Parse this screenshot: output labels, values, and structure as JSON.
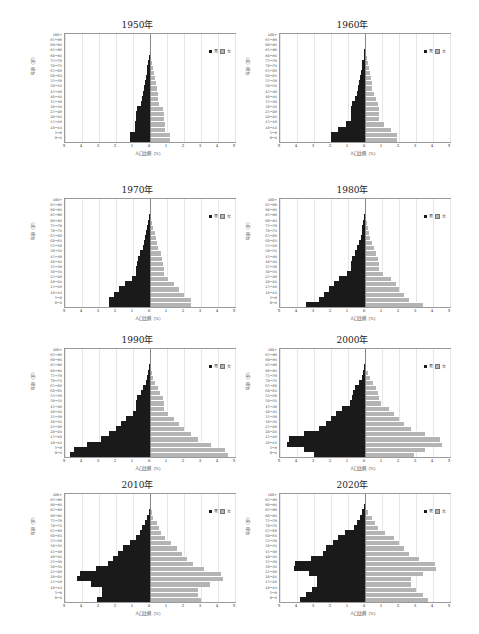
{
  "chart_data": [
    {
      "type": "bar",
      "title": "1950年",
      "xlabel": "人口比例（%）",
      "ylabel": "年龄（岁）",
      "categories": [
        "0-4",
        "5-9",
        "10-14",
        "15-19",
        "20-24",
        "25-29",
        "30-34",
        "35-39",
        "40-44",
        "45-49",
        "50-54",
        "55-59",
        "60-64",
        "65-69",
        "70-74",
        "75-79",
        "80-84",
        "85-89",
        "90-94",
        "95-99",
        "100+"
      ],
      "series": [
        {
          "name": "男",
          "values": [
            1.2,
            1.2,
            0.9,
            0.9,
            0.85,
            0.8,
            0.75,
            0.55,
            0.45,
            0.4,
            0.35,
            0.3,
            0.25,
            0.2,
            0.15,
            0.1,
            0.05,
            0.02,
            0.01,
            0.0,
            0.0
          ]
        },
        {
          "name": "女",
          "values": [
            1.2,
            1.2,
            0.9,
            0.9,
            0.85,
            0.8,
            0.75,
            0.55,
            0.45,
            0.45,
            0.4,
            0.35,
            0.3,
            0.25,
            0.2,
            0.1,
            0.06,
            0.03,
            0.01,
            0.0,
            0.0
          ]
        }
      ],
      "xlim": [
        -5,
        5
      ],
      "xticks": [
        "5",
        "4",
        "3",
        "2",
        "1",
        "0",
        "1",
        "2",
        "3",
        "4",
        "5"
      ],
      "grid": true,
      "legend_position": "upper right"
    },
    {
      "type": "bar",
      "title": "1960年",
      "xlabel": "人口比例（%）",
      "ylabel": "年龄（岁）",
      "categories": [
        "0-4",
        "5-9",
        "10-14",
        "15-19",
        "20-24",
        "25-29",
        "30-34",
        "35-39",
        "40-44",
        "45-49",
        "50-54",
        "55-59",
        "60-64",
        "65-69",
        "70-74",
        "75-79",
        "80-84",
        "85-89",
        "90-94",
        "95-99",
        "100+"
      ],
      "series": [
        {
          "name": "男",
          "values": [
            2.0,
            2.0,
            1.6,
            1.1,
            0.85,
            0.85,
            0.8,
            0.75,
            0.6,
            0.5,
            0.4,
            0.35,
            0.3,
            0.25,
            0.2,
            0.15,
            0.08,
            0.04,
            0.02,
            0.0,
            0.0
          ]
        },
        {
          "name": "女",
          "values": [
            1.9,
            1.9,
            1.5,
            1.1,
            0.85,
            0.85,
            0.8,
            0.75,
            0.65,
            0.5,
            0.4,
            0.4,
            0.35,
            0.3,
            0.25,
            0.2,
            0.1,
            0.05,
            0.02,
            0.0,
            0.0
          ]
        }
      ],
      "xlim": [
        -5,
        5
      ],
      "xticks": [
        "5",
        "4",
        "3",
        "2",
        "1",
        "0",
        "1",
        "2",
        "3",
        "4",
        "5"
      ],
      "grid": true,
      "legend_position": "upper right"
    },
    {
      "type": "bar",
      "title": "1970年",
      "xlabel": "人口比例（%）",
      "ylabel": "年龄（岁）",
      "categories": [
        "0-4",
        "5-9",
        "10-14",
        "15-19",
        "20-24",
        "25-29",
        "30-34",
        "35-39",
        "40-44",
        "45-49",
        "50-54",
        "55-59",
        "60-64",
        "65-69",
        "70-74",
        "75-79",
        "80-84",
        "85-89",
        "90-94",
        "95-99",
        "100+"
      ],
      "series": [
        {
          "name": "男",
          "values": [
            2.4,
            2.4,
            2.1,
            1.8,
            1.5,
            1.05,
            0.8,
            0.8,
            0.75,
            0.7,
            0.6,
            0.4,
            0.35,
            0.3,
            0.25,
            0.15,
            0.1,
            0.05,
            0.02,
            0.0,
            0.0
          ]
        },
        {
          "name": "女",
          "values": [
            2.4,
            2.4,
            2.0,
            1.7,
            1.4,
            1.05,
            0.8,
            0.8,
            0.75,
            0.7,
            0.65,
            0.45,
            0.4,
            0.35,
            0.3,
            0.2,
            0.12,
            0.06,
            0.02,
            0.0,
            0.0
          ]
        }
      ],
      "xlim": [
        -5,
        5
      ],
      "xticks": [
        "5",
        "4",
        "3",
        "2",
        "1",
        "0",
        "1",
        "2",
        "3",
        "4",
        "5"
      ],
      "grid": true,
      "legend_position": "upper right"
    },
    {
      "type": "bar",
      "title": "1980年",
      "xlabel": "人口比例（%）",
      "ylabel": "年龄（岁）",
      "categories": [
        "0-4",
        "5-9",
        "10-14",
        "15-19",
        "20-24",
        "25-29",
        "30-34",
        "35-39",
        "40-44",
        "45-49",
        "50-54",
        "55-59",
        "60-64",
        "65-69",
        "70-74",
        "75-79",
        "80-84",
        "85-89",
        "90-94",
        "95-99",
        "100+"
      ],
      "series": [
        {
          "name": "男",
          "values": [
            3.5,
            2.7,
            2.4,
            2.1,
            1.85,
            1.55,
            1.05,
            0.8,
            0.8,
            0.75,
            0.6,
            0.45,
            0.35,
            0.25,
            0.2,
            0.15,
            0.1,
            0.05,
            0.02,
            0.0,
            0.0
          ]
        },
        {
          "name": "女",
          "values": [
            3.4,
            2.6,
            2.3,
            2.0,
            1.8,
            1.5,
            1.05,
            0.8,
            0.8,
            0.75,
            0.65,
            0.5,
            0.4,
            0.3,
            0.25,
            0.2,
            0.12,
            0.06,
            0.02,
            0.0,
            0.0
          ]
        }
      ],
      "xlim": [
        -5,
        5
      ],
      "xticks": [
        "5",
        "4",
        "3",
        "2",
        "1",
        "0",
        "1",
        "2",
        "3",
        "4",
        "5"
      ],
      "grid": true,
      "legend_position": "upper right"
    },
    {
      "type": "bar",
      "title": "1990年",
      "xlabel": "人口比例（%）",
      "ylabel": "年龄（岁）",
      "categories": [
        "0-4",
        "5-9",
        "10-14",
        "15-19",
        "20-24",
        "25-29",
        "30-34",
        "35-39",
        "40-44",
        "45-49",
        "50-54",
        "55-59",
        "60-64",
        "65-69",
        "70-74",
        "75-79",
        "80-84",
        "85-89",
        "90-94",
        "95-99",
        "100+"
      ],
      "series": [
        {
          "name": "男",
          "values": [
            4.7,
            4.5,
            3.7,
            2.9,
            2.4,
            2.0,
            1.7,
            1.4,
            1.0,
            0.8,
            0.8,
            0.75,
            0.55,
            0.4,
            0.25,
            0.15,
            0.1,
            0.05,
            0.02,
            0.0,
            0.0
          ]
        },
        {
          "name": "女",
          "values": [
            4.6,
            4.4,
            3.6,
            2.8,
            2.4,
            2.0,
            1.7,
            1.4,
            1.05,
            0.8,
            0.8,
            0.75,
            0.6,
            0.45,
            0.3,
            0.2,
            0.12,
            0.06,
            0.02,
            0.0,
            0.0
          ]
        }
      ],
      "xlim": [
        -5,
        5
      ],
      "xticks": [
        "5",
        "4",
        "3",
        "2",
        "1",
        "0",
        "1",
        "2",
        "3",
        "4",
        "5"
      ],
      "grid": true,
      "legend_position": "upper right"
    },
    {
      "type": "bar",
      "title": "2000年",
      "xlabel": "人口比例（%）",
      "ylabel": "年龄（岁）",
      "categories": [
        "0-4",
        "5-9",
        "10-14",
        "15-19",
        "20-24",
        "25-29",
        "30-34",
        "35-39",
        "40-44",
        "45-49",
        "50-54",
        "55-59",
        "60-64",
        "65-69",
        "70-74",
        "75-79",
        "80-84",
        "85-89",
        "90-94",
        "95-99",
        "100+"
      ],
      "series": [
        {
          "name": "男",
          "values": [
            3.0,
            3.6,
            4.6,
            4.5,
            3.6,
            2.7,
            2.3,
            2.0,
            1.7,
            1.35,
            0.9,
            0.75,
            0.7,
            0.6,
            0.35,
            0.2,
            0.1,
            0.05,
            0.02,
            0.0,
            0.0
          ]
        },
        {
          "name": "女",
          "values": [
            2.9,
            3.5,
            4.5,
            4.4,
            3.5,
            2.7,
            2.3,
            2.0,
            1.7,
            1.4,
            0.95,
            0.8,
            0.75,
            0.65,
            0.45,
            0.3,
            0.15,
            0.07,
            0.02,
            0.0,
            0.0
          ]
        }
      ],
      "xlim": [
        -5,
        5
      ],
      "xticks": [
        "5",
        "4",
        "3",
        "2",
        "1",
        "0",
        "1",
        "2",
        "3",
        "4",
        "5"
      ],
      "grid": true,
      "legend_position": "upper right"
    },
    {
      "type": "bar",
      "title": "2010年",
      "xlabel": "人口比例（%）",
      "ylabel": "年龄（岁）",
      "categories": [
        "0-4",
        "5-9",
        "10-14",
        "15-19",
        "20-24",
        "25-29",
        "30-34",
        "35-39",
        "40-44",
        "45-49",
        "50-54",
        "55-59",
        "60-64",
        "65-69",
        "70-74",
        "75-79",
        "80-84",
        "85-89",
        "90-94",
        "95-99",
        "100+"
      ],
      "series": [
        {
          "name": "男",
          "values": [
            3.1,
            2.8,
            2.8,
            3.5,
            4.3,
            4.1,
            3.2,
            2.5,
            2.2,
            1.9,
            1.6,
            1.2,
            0.8,
            0.6,
            0.5,
            0.3,
            0.15,
            0.07,
            0.02,
            0.0,
            0.0
          ]
        },
        {
          "name": "女",
          "values": [
            3.0,
            2.8,
            2.8,
            3.5,
            4.3,
            4.2,
            3.2,
            2.5,
            2.2,
            1.9,
            1.6,
            1.25,
            0.9,
            0.65,
            0.55,
            0.4,
            0.2,
            0.1,
            0.03,
            0.0,
            0.0
          ]
        }
      ],
      "xlim": [
        -5,
        5
      ],
      "xticks": [
        "5",
        "4",
        "3",
        "2",
        "1",
        "0",
        "1",
        "2",
        "3",
        "4",
        "5"
      ],
      "grid": true,
      "legend_position": "upper right"
    },
    {
      "type": "bar",
      "title": "2020年",
      "xlabel": "人口比例（%）",
      "ylabel": "年龄（岁）",
      "categories": [
        "0-4",
        "5-9",
        "10-14",
        "15-19",
        "20-24",
        "25-29",
        "30-34",
        "35-39",
        "40-44",
        "45-49",
        "50-54",
        "55-59",
        "60-64",
        "65-69",
        "70-74",
        "75-79",
        "80-84",
        "85-89",
        "90-94",
        "95-99",
        "100+"
      ],
      "series": [
        {
          "name": "男",
          "values": [
            3.8,
            3.5,
            3.1,
            2.8,
            2.8,
            3.3,
            4.2,
            4.1,
            3.2,
            2.5,
            2.3,
            1.9,
            1.6,
            1.2,
            0.65,
            0.5,
            0.3,
            0.15,
            0.05,
            0.0,
            0.0
          ]
        },
        {
          "name": "女",
          "values": [
            3.7,
            3.4,
            3.0,
            2.7,
            2.7,
            3.4,
            4.2,
            4.1,
            3.2,
            2.6,
            2.3,
            2.0,
            1.7,
            1.2,
            0.75,
            0.6,
            0.4,
            0.2,
            0.07,
            0.0,
            0.0
          ]
        }
      ],
      "xlim": [
        -5,
        5
      ],
      "xticks": [
        "5",
        "4",
        "3",
        "2",
        "1",
        "0",
        "1",
        "2",
        "3",
        "4",
        "5"
      ],
      "grid": true,
      "legend_position": "upper right"
    }
  ],
  "legend": {
    "male": "男",
    "female": "女"
  },
  "colors": {
    "male": "#1a1a1a",
    "female": "#b4b4b4",
    "grid": "#e6e6e6",
    "axis": "#9a9a9a"
  }
}
